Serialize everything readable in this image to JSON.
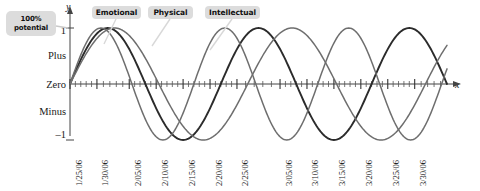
{
  "callout": {
    "line1": "100%",
    "line2": "potential",
    "name": "100% potential"
  },
  "axes": {
    "x_letter": "x",
    "y_letter": "y",
    "y_labels": {
      "top_value": "1",
      "plus": "Plus",
      "zero": "Zero",
      "minus": "Minus",
      "bottom_value": "–1"
    }
  },
  "legend": [
    {
      "label": "Emotional",
      "color": "#2b2b2b"
    },
    {
      "label": "Physical",
      "color": "#6e6e6e"
    },
    {
      "label": "Intellectual",
      "color": "#6e6e6e"
    }
  ],
  "chart_data": {
    "type": "line",
    "title": "",
    "xlabel": "x",
    "ylabel": "y",
    "ylim": [
      -1,
      1
    ],
    "xlim": [
      0,
      70
    ],
    "grid": false,
    "legend_position": "top",
    "y_tick_labels": [
      "1",
      "Plus",
      "Zero",
      "Minus",
      "-1"
    ],
    "y_tick_values": [
      1,
      0.5,
      0,
      -0.5,
      -1
    ],
    "x_tick_labels": [
      "1/25/06",
      "1/30/06",
      "2/05/06",
      "2/10/06",
      "2/15/06",
      "2/20/06",
      "2/25/06",
      "3/05/06",
      "3/10/06",
      "3/15/06",
      "3/20/06",
      "3/25/06",
      "3/30/06"
    ],
    "x_tick_days": [
      0,
      5,
      11,
      16,
      21,
      26,
      31,
      39,
      44,
      49,
      54,
      59,
      64
    ],
    "minor_ticks_per_interval": 5,
    "series": [
      {
        "name": "Emotional",
        "color": "#2b2b2b",
        "period_days": 28,
        "amplitude": 1,
        "phase": 0,
        "formula": "sin(2*pi*t/28)"
      },
      {
        "name": "Physical",
        "color": "#6e6e6e",
        "period_days": 23,
        "amplitude": 1,
        "phase": 0,
        "formula": "sin(2*pi*t/23)"
      },
      {
        "name": "Intellectual",
        "color": "#6e6e6e",
        "period_days": 33,
        "amplitude": 1,
        "phase": 0,
        "formula": "sin(2*pi*t/33)"
      }
    ],
    "annotations": [
      {
        "text": "100% potential",
        "points_to": "y = 1"
      }
    ]
  }
}
